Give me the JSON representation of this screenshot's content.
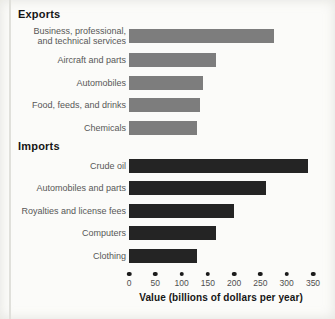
{
  "chart_data": {
    "type": "bar",
    "orientation": "horizontal",
    "title": "",
    "xlabel": "Value (billions of dollars per year)",
    "xlim": [
      0,
      350
    ],
    "x_ticks": [
      0,
      50,
      100,
      150,
      200,
      250,
      300,
      350
    ],
    "grid": false,
    "legend": "none",
    "tick_style": "dots",
    "colors": {
      "exports_bar": "#7d7d7d",
      "imports_bar": "#242424",
      "tick_dot": "#1b1b1b",
      "label_text": "#575757",
      "header_text": "#161616",
      "page_background": "#fbfbf9"
    },
    "groups": [
      {
        "label": "Exports",
        "color": "#7d7d7d",
        "items": [
          {
            "label": "Business, professional,\nand technical services",
            "value": 275
          },
          {
            "label": "Aircraft and parts",
            "value": 165
          },
          {
            "label": "Automobiles",
            "value": 140
          },
          {
            "label": "Food, feeds, and drinks",
            "value": 135
          },
          {
            "label": "Chemicals",
            "value": 130
          }
        ]
      },
      {
        "label": "Imports",
        "color": "#242424",
        "items": [
          {
            "label": "Crude oil",
            "value": 340
          },
          {
            "label": "Automobiles and parts",
            "value": 260
          },
          {
            "label": "Royalties and license fees",
            "value": 200
          },
          {
            "label": "Computers",
            "value": 165
          },
          {
            "label": "Clothing",
            "value": 130
          }
        ]
      }
    ]
  }
}
